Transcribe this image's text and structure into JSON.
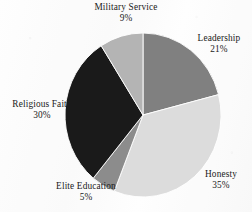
{
  "chart_data": {
    "type": "pie",
    "title": "",
    "subtitle": "",
    "xlabel": "",
    "ylabel": "",
    "legend_position": "none",
    "grid": false,
    "labels_outside": true,
    "start_angle_deg": 0,
    "direction": "clockwise",
    "categories": [
      "Leadership",
      "Honesty",
      "Elite Education",
      "Religious Faith",
      "Military Service"
    ],
    "values": [
      21,
      35,
      5,
      30,
      9
    ],
    "value_unit": "%",
    "colors": [
      "#808080",
      "#dcdcdc",
      "#8c8c8c",
      "#1a1a1a",
      "#b4b4b4"
    ],
    "slices": [
      {
        "label": "Leadership",
        "value": 21,
        "value_text": "21%",
        "color": "#808080"
      },
      {
        "label": "Honesty",
        "value": 35,
        "value_text": "35%",
        "color": "#dcdcdc"
      },
      {
        "label": "Elite Education",
        "value": 5,
        "value_text": "5%",
        "color": "#8c8c8c"
      },
      {
        "label": "Religious Faith",
        "value": 30,
        "value_text": "30%",
        "color": "#1a1a1a"
      },
      {
        "label": "Military Service",
        "value": 9,
        "value_text": "9%",
        "color": "#b4b4b4"
      }
    ]
  },
  "labels": {
    "military": {
      "name": "Military Service",
      "pct": "9%"
    },
    "leadership": {
      "name": "Leadership",
      "pct": "21%"
    },
    "honesty": {
      "name": "Honesty",
      "pct": "35%"
    },
    "elite": {
      "name": "Elite Education",
      "pct": "5%"
    },
    "religious": {
      "name": "Religious Faith",
      "pct": "30%"
    }
  },
  "style": {
    "background_color": "#fbfbfb",
    "text_color": "#1a1a1a",
    "slice_outline_color": "#ffffff"
  }
}
